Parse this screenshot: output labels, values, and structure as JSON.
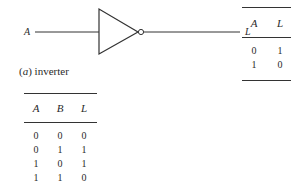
{
  "diagram": {
    "gate": {
      "type": "inverter",
      "input_label": "A",
      "output_label": "L"
    },
    "caption": {
      "letter": "a",
      "text": "inverter"
    }
  },
  "inverter_truth_table": {
    "headers": [
      "A",
      "L"
    ],
    "rows": [
      [
        "0",
        "1"
      ],
      [
        "1",
        "0"
      ]
    ]
  },
  "xor_truth_table": {
    "headers": [
      "A",
      "B",
      "L"
    ],
    "rows": [
      [
        "0",
        "0",
        "0"
      ],
      [
        "0",
        "1",
        "1"
      ],
      [
        "1",
        "0",
        "1"
      ],
      [
        "1",
        "1",
        "0"
      ]
    ]
  }
}
